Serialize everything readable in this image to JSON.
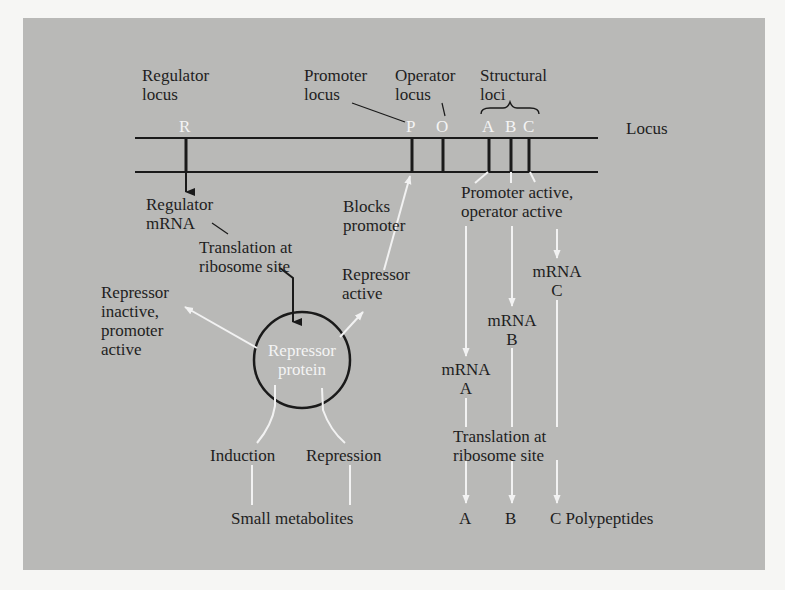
{
  "figure": {
    "title_labels": {
      "regulator_locus": [
        "Regulator",
        "locus"
      ],
      "promoter_locus": [
        "Promoter",
        "locus"
      ],
      "operator_locus": [
        "Operator",
        "locus"
      ],
      "structural_loci": [
        "Structural",
        "loci"
      ],
      "locus": "Locus"
    },
    "gene_letters": {
      "R": "R",
      "P": "P",
      "O": "O",
      "A": "A",
      "B": "B",
      "C": "C"
    },
    "regulator_branch": {
      "regulator_mrna": [
        "Regulator",
        "mRNA"
      ],
      "translation": [
        "Translation at",
        "ribosome site"
      ],
      "repressor_protein": [
        "Repressor",
        "protein"
      ],
      "repressor_inactive": [
        "Repressor",
        "inactive,",
        "promoter",
        "active"
      ],
      "repressor_active": [
        "Repressor",
        "active"
      ],
      "blocks_promoter": [
        "Blocks",
        "promoter"
      ],
      "induction": "Induction",
      "repression": "Repression",
      "small_metabolites": "Small metabolites"
    },
    "structural_branch": {
      "promoter_active": [
        "Promoter active,",
        "operator active"
      ],
      "mrna_a": [
        "mRNA",
        "A"
      ],
      "mrna_b": [
        "mRNA",
        "B"
      ],
      "mrna_c": [
        "mRNA",
        "C"
      ],
      "translation": [
        "Translation at",
        "ribosome site"
      ],
      "polypeptide_a": "A",
      "polypeptide_b": "B",
      "polypeptide_c": "C Polypeptides"
    },
    "colors": {
      "background": "#b9b9b7",
      "line_dark": "#1a1a1a",
      "arrow_white": "#f2f2f2",
      "text": "#1e1e1e"
    }
  }
}
